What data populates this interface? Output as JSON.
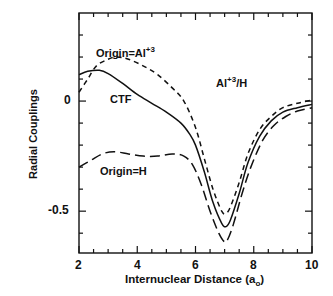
{
  "chart_data": {
    "type": "line",
    "title": "",
    "xlabel": "Internuclear Distance (a_o)",
    "xlabel_main": "Internuclear Distance (a",
    "xlabel_sub": "o",
    "xlabel_close": ")",
    "ylabel": "Radial Couplings",
    "xlim": [
      2,
      10
    ],
    "ylim": [
      -0.69,
      0.4
    ],
    "xticks": [
      2,
      4,
      6,
      8,
      10
    ],
    "xtick_labels": [
      "2",
      "4",
      "6",
      "8",
      "10"
    ],
    "yticks": [
      0,
      -0.5
    ],
    "ytick_labels": [
      "0",
      "-0.5"
    ],
    "grid": false,
    "annotation": {
      "base": "Al",
      "sup": "+3",
      "rest": "/H"
    },
    "series": [
      {
        "name": "CTF",
        "style": "solid",
        "label": "CTF",
        "x": [
          2.0,
          2.3,
          2.7,
          3.0,
          3.5,
          4.0,
          4.5,
          5.0,
          5.5,
          5.8,
          6.0,
          6.3,
          6.6,
          6.9,
          7.05,
          7.2,
          7.5,
          7.8,
          8.2,
          8.6,
          9.0,
          9.5,
          10.0
        ],
        "y": [
          0.12,
          0.135,
          0.14,
          0.125,
          0.08,
          0.03,
          -0.01,
          -0.05,
          -0.1,
          -0.15,
          -0.2,
          -0.32,
          -0.46,
          -0.555,
          -0.57,
          -0.54,
          -0.42,
          -0.28,
          -0.16,
          -0.09,
          -0.05,
          -0.03,
          -0.015
        ]
      },
      {
        "name": "Origin=Al+3",
        "style": "short-dash",
        "label": "Origin=Al",
        "label_sup": "+3",
        "x": [
          2.0,
          2.3,
          2.6,
          3.0,
          3.3,
          3.7,
          4.2,
          4.7,
          5.2,
          5.6,
          6.0,
          6.3,
          6.6,
          6.9,
          7.05,
          7.2,
          7.5,
          7.8,
          8.2,
          8.6,
          9.0,
          9.5,
          10.0
        ],
        "y": [
          0.04,
          0.1,
          0.16,
          0.19,
          0.2,
          0.19,
          0.16,
          0.12,
          0.06,
          0.0,
          -0.12,
          -0.26,
          -0.4,
          -0.5,
          -0.51,
          -0.48,
          -0.37,
          -0.24,
          -0.13,
          -0.07,
          -0.03,
          -0.01,
          0.005
        ]
      },
      {
        "name": "Origin=H",
        "style": "long-dash",
        "label": "Origin=H",
        "x": [
          2.0,
          2.4,
          2.8,
          3.2,
          3.7,
          4.2,
          4.7,
          5.2,
          5.6,
          5.9,
          6.2,
          6.5,
          6.8,
          7.0,
          7.1,
          7.3,
          7.6,
          7.9,
          8.3,
          8.7,
          9.1,
          9.5,
          10.0
        ],
        "y": [
          -0.3,
          -0.27,
          -0.24,
          -0.23,
          -0.24,
          -0.25,
          -0.25,
          -0.24,
          -0.25,
          -0.29,
          -0.38,
          -0.5,
          -0.6,
          -0.64,
          -0.63,
          -0.56,
          -0.42,
          -0.3,
          -0.18,
          -0.11,
          -0.07,
          -0.045,
          -0.03
        ]
      }
    ]
  }
}
